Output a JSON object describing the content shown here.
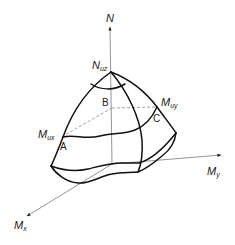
{
  "diagram": {
    "axes": {
      "n": {
        "main": "N",
        "sub": ""
      },
      "my": {
        "main": "M",
        "sub": "y"
      },
      "mx": {
        "main": "M",
        "sub": "x"
      }
    },
    "labels": {
      "nuz": {
        "main": "N",
        "sub": "uz"
      },
      "mux": {
        "main": "M",
        "sub": "ux"
      },
      "muy": {
        "main": "M",
        "sub": "uy"
      }
    },
    "points": {
      "a": "A",
      "b": "B",
      "c": "C"
    },
    "colors": {
      "curve": "#111111",
      "axis": "#7a7a7a",
      "dashed": "#8a8a8a",
      "text": "#222222"
    }
  }
}
